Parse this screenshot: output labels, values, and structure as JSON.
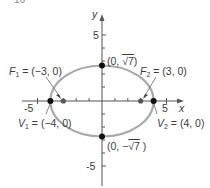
{
  "header_fragment": "16",
  "axes": {
    "x_label": "x",
    "y_label": "y",
    "x_ticks": [
      "-5",
      "5"
    ],
    "y_ticks": [
      "5",
      "-5"
    ]
  },
  "ellipse": {
    "equation_hint": "x^2/16 + y^2/7 = 1",
    "a": 4,
    "b_display": "√7",
    "c": 3,
    "stroke_color": "#a9a9a9"
  },
  "points": {
    "top": {
      "label_prefix": "(0, ",
      "label_root": "√7",
      "label_suffix": ")"
    },
    "bottom": {
      "label_prefix": "(0, −",
      "label_root": "√7",
      "label_suffix": " )"
    },
    "f1": {
      "name": "F",
      "sub": "1",
      "value": " = (−3, 0)"
    },
    "f2": {
      "name": "F",
      "sub": "2",
      "value": " = (3, 0)"
    },
    "v1": {
      "name": "V",
      "sub": "1",
      "value": " = (−4, 0)"
    },
    "v2": {
      "name": "V",
      "sub": "2",
      "value": " = (4, 0)"
    }
  },
  "colors": {
    "axis": "#555555",
    "vertex": "#111111",
    "focus": "#555555",
    "text": "#3a3a3a"
  }
}
